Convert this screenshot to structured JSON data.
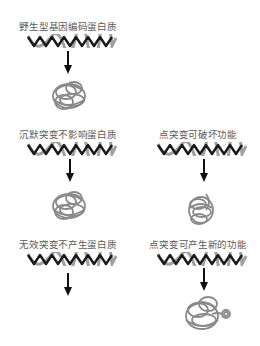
{
  "diagram": {
    "panels": [
      {
        "id": "wildtype",
        "label": "野生型基因编码蛋白质",
        "has_dna": true,
        "has_arrow": true,
        "protein": "normal"
      },
      {
        "id": "silent",
        "label": "沉默突变不影响蛋白质",
        "has_dna": true,
        "has_arrow": true,
        "protein": "normal"
      },
      {
        "id": "point-destroy",
        "label": "点突变可破坏功能",
        "has_dna": true,
        "has_arrow": true,
        "protein": "misfolded"
      },
      {
        "id": "null",
        "label": "无效突变不产生蛋白质",
        "has_dna": true,
        "has_arrow": true,
        "protein": "none"
      },
      {
        "id": "point-new",
        "label": "点突变可产生新的功能",
        "has_dna": true,
        "has_arrow": true,
        "protein": "new-function"
      }
    ],
    "colors": {
      "dna_dark": "#1a1a1a",
      "dna_light": "#9a9a9a",
      "protein": "#8a8a8a",
      "arrow": "#111111",
      "text": "#5a5a5a"
    }
  }
}
